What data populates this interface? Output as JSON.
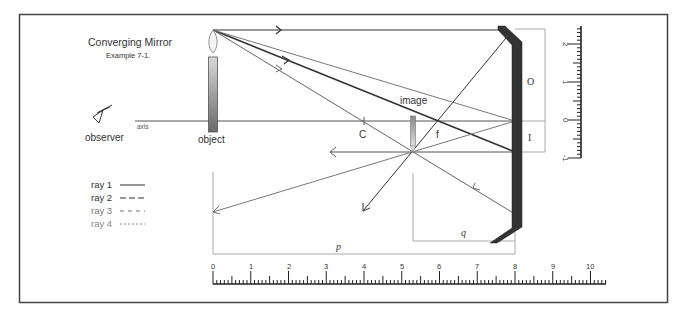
{
  "title": "Converging Mirror",
  "subtitle": "Example 7-1.",
  "labels": {
    "observer": "observer",
    "axis": "axis",
    "object": "object",
    "image": "image",
    "center": "C",
    "focus": "f",
    "object_height": "O",
    "image_height": "I",
    "object_distance": "p",
    "image_distance": "q"
  },
  "legend": [
    {
      "label": "ray 1",
      "style": "solid",
      "color": "#333333"
    },
    {
      "label": "ray 2",
      "style": "long-dash",
      "color": "#333333"
    },
    {
      "label": "ray 3",
      "style": "dash",
      "color": "#777777"
    },
    {
      "label": "ray 4",
      "style": "dot",
      "color": "#888888"
    }
  ],
  "horizontal_ruler": {
    "ticks": [
      "0",
      "1",
      "2",
      "3",
      "4",
      "5",
      "6",
      "7",
      "8",
      "9",
      "10"
    ]
  },
  "vertical_ruler": {
    "ticks": [
      "2",
      "1",
      "0",
      "-1"
    ]
  },
  "colors": {
    "frame": "#444444",
    "mirror": "#333333",
    "ray_dark": "#444444",
    "ray_light": "#777777",
    "guide": "#aaaaaa"
  },
  "chart_data": {
    "type": "ray-diagram",
    "title": "Converging Mirror",
    "subtitle": "Example 7-1.",
    "object_distance_p": 8,
    "image_distance_q": 2.7,
    "center_of_curvature_C": 4,
    "focal_point_f": 2,
    "object_height_O": 2.4,
    "image_height_I": -0.8,
    "horizontal_scale": [
      0,
      10
    ],
    "vertical_scale": [
      -1,
      2.4
    ]
  }
}
